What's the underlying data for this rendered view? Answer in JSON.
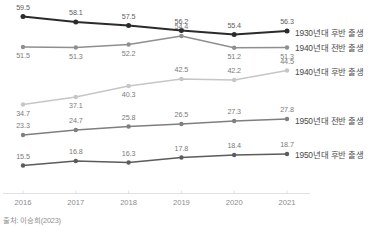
{
  "chart_data": {
    "type": "line",
    "title": "",
    "xlabel": "",
    "ylabel": "",
    "grid": false,
    "legend_position": "right-inline",
    "categories": [
      "2016",
      "2017",
      "2018",
      "2019",
      "2020",
      "2021"
    ],
    "series": [
      {
        "name": "1930년대 후반 출생",
        "color": "#2b2b2b",
        "values": [
          59.5,
          58.1,
          57.5,
          56.2,
          55.4,
          56.3
        ],
        "labels": [
          "59.5",
          "58.1",
          "57.5",
          "56.2",
          "55.4",
          "56.3"
        ]
      },
      {
        "name": "1940년대 전반 출생",
        "color": "#8f8f8f",
        "values": [
          51.5,
          51.3,
          52.2,
          54.4,
          51.2,
          51.3
        ],
        "labels": [
          "51.5",
          "51.3",
          "52.2",
          "54.4",
          "51.2",
          "51.3"
        ]
      },
      {
        "name": "1940년대 후반 출생",
        "color": "#c6c6c6",
        "values": [
          34.7,
          37.1,
          40.3,
          42.5,
          42.2,
          44.5
        ],
        "labels": [
          "34.7",
          "37.1",
          "40.3",
          "42.5",
          "42.2",
          "44.5"
        ]
      },
      {
        "name": "1950년대 전반 출생",
        "color": "#7f7f7f",
        "values": [
          23.3,
          24.7,
          25.8,
          26.5,
          27.3,
          27.8
        ],
        "labels": [
          "23.3",
          "24.7",
          "25.8",
          "26.5",
          "27.3",
          "27.8"
        ]
      },
      {
        "name": "1950년대 후반 출생",
        "color": "#5c5c5c",
        "values": [
          15.5,
          16.8,
          16.3,
          17.8,
          18.4,
          18.7
        ],
        "labels": [
          "15.5",
          "16.8",
          "16.3",
          "17.8",
          "18.4",
          "18.7"
        ]
      }
    ]
  },
  "axis": {
    "x_ticks": [
      "2016",
      "2017",
      "2018",
      "2019",
      "2020",
      "2021"
    ]
  },
  "legend": {
    "items": [
      "1930년대 후반 출생",
      "1940년대 전반 출생",
      "1940년대 후반 출생",
      "1950년대 전반 출생",
      "1950년대 후반 출생"
    ]
  },
  "footer": {
    "source": "출처: 이승희(2023)"
  },
  "colors": {
    "series_1": "#2b2b2b",
    "series_2": "#8f8f8f",
    "series_3": "#c6c6c6",
    "series_4": "#7f7f7f",
    "series_5": "#5c5c5c",
    "axis": "#d9d9d9",
    "label_text": "#7a7a7a",
    "legend_text": "#4a4a4a"
  }
}
